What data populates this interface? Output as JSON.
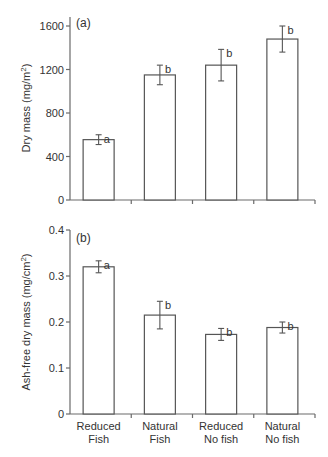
{
  "chart_data": [
    {
      "type": "bar",
      "panel_label": "(a)",
      "title": "",
      "xlabel": "",
      "ylabel": "Dry mass (mg/m²)",
      "ylim": [
        0,
        1600
      ],
      "yticks": [
        0,
        400,
        800,
        1200,
        1600
      ],
      "grid": false,
      "categories": [
        "Reduced Fish",
        "Natural Fish",
        "Reduced No fish",
        "Natural No fish"
      ],
      "values": [
        555,
        1150,
        1240,
        1480
      ],
      "errors": [
        45,
        90,
        145,
        120
      ],
      "significance_letters": [
        "a",
        "b",
        "b",
        "b"
      ]
    },
    {
      "type": "bar",
      "panel_label": "(b)",
      "title": "",
      "xlabel": "",
      "ylabel": "Ash-free dry mass (mg/cm²)",
      "ylim": [
        0,
        0.4
      ],
      "yticks": [
        0,
        0.1,
        0.2,
        0.3,
        0.4
      ],
      "grid": false,
      "categories": [
        "Reduced Fish",
        "Natural Fish",
        "Reduced No fish",
        "Natural No fish"
      ],
      "values": [
        0.32,
        0.215,
        0.173,
        0.188
      ],
      "errors": [
        0.013,
        0.03,
        0.013,
        0.012
      ],
      "significance_letters": [
        "a",
        "b",
        "b",
        "b"
      ]
    }
  ],
  "labels": {
    "panel_a": "(a)",
    "panel_b": "(b)",
    "ylabel_a_main": "Dry mass (mg/m",
    "ylabel_a_sup": "2",
    "ylabel_a_end": ")",
    "ylabel_b_main": "Ash-free dry mass (mg/cm",
    "ylabel_b_sup": "2",
    "ylabel_b_end": ")",
    "yticks_a": [
      "0",
      "400",
      "800",
      "1200",
      "1600"
    ],
    "yticks_b": [
      "0",
      "0.1",
      "0.2",
      "0.3",
      "0.4"
    ],
    "categories_line1": [
      "Reduced",
      "Natural",
      "Reduced",
      "Natural"
    ],
    "categories_line2": [
      "Fish",
      "Fish",
      "No fish",
      "No fish"
    ]
  }
}
